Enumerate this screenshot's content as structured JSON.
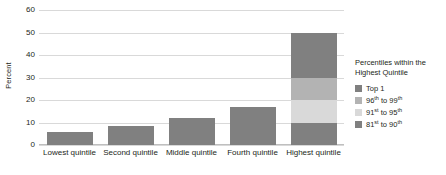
{
  "chart_data": {
    "type": "bar",
    "stacked": true,
    "title": "",
    "xlabel": "",
    "ylabel": "Percent",
    "ylim": [
      0,
      60
    ],
    "yticks": [
      0,
      10,
      20,
      30,
      40,
      50,
      60
    ],
    "ytick_labels": [
      "0",
      "10",
      "20",
      "30",
      "40",
      "50",
      "60"
    ],
    "grid": true,
    "categories": [
      "Lowest quintile",
      "Second quintile",
      "Middle quintile",
      "Fourth quintile",
      "Highest quintile"
    ],
    "values": [
      6,
      8.5,
      12,
      17,
      50
    ],
    "series": [
      {
        "name": "81st to 90th",
        "name_parts": {
          "prefix": "81",
          "sup1": "st",
          "middle": " to 90",
          "sup2": "th"
        },
        "color": "#808080",
        "values": [
          6,
          8.5,
          12,
          17,
          10
        ]
      },
      {
        "name": "91st to 95th",
        "name_parts": {
          "prefix": "91",
          "sup1": "st",
          "middle": " to 95",
          "sup2": "th"
        },
        "color": "#d9d9d9",
        "values": [
          0,
          0,
          0,
          0,
          10
        ]
      },
      {
        "name": "96th to 99th",
        "name_parts": {
          "prefix": "96",
          "sup1": "th",
          "middle": " to 99",
          "sup2": "th"
        },
        "color": "#b3b3b3",
        "values": [
          0,
          0,
          0,
          0,
          10
        ]
      },
      {
        "name": "Top 1",
        "name_parts": {
          "prefix": "Top 1",
          "sup1": "",
          "middle": "",
          "sup2": ""
        },
        "color": "#808080",
        "values": [
          0,
          0,
          0,
          0,
          20
        ]
      }
    ],
    "legend": {
      "position": "right",
      "title_line_1": "Percentiles within the",
      "title_line_2": "Highest Quintile",
      "entries": [
        {
          "label": "Top 1",
          "color": "#808080"
        },
        {
          "label": "96th to 99th",
          "color": "#b3b3b3"
        },
        {
          "label": "91st to 95th",
          "color": "#d9d9d9"
        },
        {
          "label": "81st to 90th",
          "color": "#808080"
        }
      ]
    },
    "colors": {
      "bar_default": "#808080",
      "gridline": "#d9d9d9",
      "text": "#231f20",
      "background": "#ffffff"
    }
  }
}
